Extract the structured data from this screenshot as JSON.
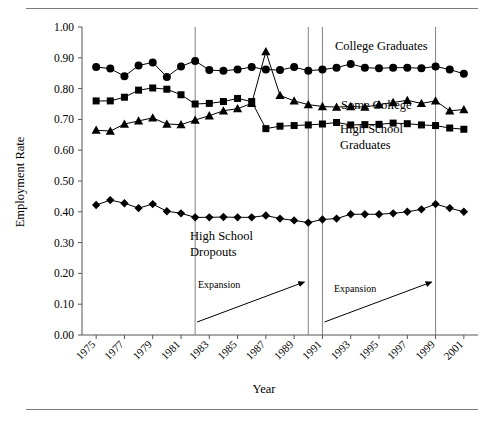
{
  "figure": {
    "has_top_rule": true,
    "has_bottom_rule": true,
    "background_color": "#ffffff",
    "ink_color": "#000000",
    "guide_color": "#808080"
  },
  "chart_data": {
    "type": "line",
    "title": "",
    "xlabel": "Year",
    "ylabel": "Employment Rate",
    "xlim": [
      1974,
      2002
    ],
    "ylim": [
      0.0,
      1.0
    ],
    "grid": false,
    "legend_position": "inline-annotations",
    "y_ticks": [
      "0.00",
      "0.10",
      "0.20",
      "0.30",
      "0.40",
      "0.50",
      "0.60",
      "0.70",
      "0.80",
      "0.90",
      "1.00"
    ],
    "y_tick_values": [
      0.0,
      0.1,
      0.2,
      0.3,
      0.4,
      0.5,
      0.6,
      0.7,
      0.8,
      0.9,
      1.0
    ],
    "x_ticks": [
      "1975",
      "1977",
      "1979",
      "1981",
      "1983",
      "1985",
      "1987",
      "1989",
      "1991",
      "1993",
      "1995",
      "1997",
      "1999",
      "2001"
    ],
    "x_tick_values": [
      1975,
      1977,
      1979,
      1981,
      1983,
      1985,
      1987,
      1989,
      1991,
      1993,
      1995,
      1997,
      1999,
      2001
    ],
    "x": [
      1975,
      1976,
      1977,
      1978,
      1979,
      1980,
      1981,
      1982,
      1983,
      1984,
      1985,
      1986,
      1987,
      1988,
      1989,
      1990,
      1991,
      1992,
      1993,
      1994,
      1995,
      1996,
      1997,
      1998,
      1999,
      2000,
      2001
    ],
    "series": [
      {
        "name": "College Graduates",
        "marker": "circle",
        "values": [
          0.87,
          0.865,
          0.84,
          0.875,
          0.885,
          0.838,
          0.872,
          0.89,
          0.86,
          0.858,
          0.862,
          0.87,
          0.862,
          0.86,
          0.87,
          0.858,
          0.862,
          0.868,
          0.88,
          0.868,
          0.866,
          0.868,
          0.868,
          0.866,
          0.872,
          0.862,
          0.848
        ]
      },
      {
        "name": "Some College",
        "marker": "triangle",
        "values": [
          0.665,
          0.662,
          0.685,
          0.695,
          0.705,
          0.685,
          0.683,
          0.698,
          0.712,
          0.728,
          0.735,
          0.752,
          0.92,
          0.778,
          0.76,
          0.748,
          0.742,
          0.74,
          0.742,
          0.74,
          0.748,
          0.755,
          0.762,
          0.752,
          0.76,
          0.728,
          0.732
        ]
      },
      {
        "name": "High School Graduates",
        "marker": "square",
        "values": [
          0.76,
          0.76,
          0.772,
          0.795,
          0.802,
          0.798,
          0.78,
          0.75,
          0.752,
          0.758,
          0.768,
          0.758,
          0.67,
          0.678,
          0.68,
          0.682,
          0.685,
          0.69,
          0.682,
          0.683,
          0.684,
          0.688,
          0.686,
          0.682,
          0.68,
          0.672,
          0.668
        ]
      },
      {
        "name": "High School Dropouts",
        "marker": "diamond",
        "values": [
          0.422,
          0.438,
          0.428,
          0.412,
          0.425,
          0.402,
          0.395,
          0.382,
          0.382,
          0.383,
          0.382,
          0.382,
          0.388,
          0.378,
          0.372,
          0.365,
          0.375,
          0.378,
          0.392,
          0.392,
          0.392,
          0.395,
          0.4,
          0.408,
          0.425,
          0.412,
          0.4
        ]
      }
    ],
    "annotations": [
      {
        "label": "Expansion",
        "from_year": 1982,
        "to_year": 1990
      },
      {
        "label": "Expansion",
        "from_year": 1991,
        "to_year": 1999
      }
    ],
    "recession_markers": [
      1982,
      1990,
      1991,
      1999
    ]
  },
  "series_labels": {
    "college_graduates": "College Graduates",
    "some_college": "Some College",
    "high_school_graduates_line1": "High School",
    "high_school_graduates_line2": "Graduates",
    "high_school_dropouts_line1": "High School",
    "high_school_dropouts_line2": "Dropouts"
  },
  "axis_titles": {
    "x": "Year",
    "y": "Employment Rate"
  },
  "annotation_labels": {
    "expansion_first": "Expansion",
    "expansion_second": "Expansion"
  }
}
